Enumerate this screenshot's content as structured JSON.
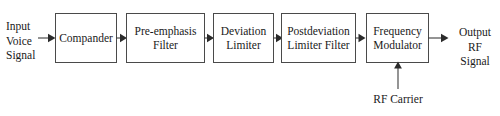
{
  "diagram": {
    "type": "block-diagram",
    "background_color": "#ffffff",
    "stroke_color": "#3d3d3d",
    "text_color": "#1a1a1a",
    "blocks": [
      {
        "id": "compander",
        "label": "Compander"
      },
      {
        "id": "pre-emphasis-filter",
        "label": "Pre-emphasis\nFilter"
      },
      {
        "id": "deviation-limiter",
        "label": "Deviation\nLimiter"
      },
      {
        "id": "postdeviation-limiter-filter",
        "label": "Postdeviation\nLimiter Filter"
      },
      {
        "id": "frequency-modulator",
        "label": "Frequency\nModulator"
      }
    ],
    "labels": {
      "input": "Input\nVoice\nSignal",
      "output": "Output\nRF Signal",
      "carrier": "RF Carrier"
    },
    "connections": [
      {
        "from": "input-voice-signal",
        "to": "compander",
        "direction": "right"
      },
      {
        "from": "compander",
        "to": "pre-emphasis-filter",
        "direction": "right"
      },
      {
        "from": "pre-emphasis-filter",
        "to": "deviation-limiter",
        "direction": "right"
      },
      {
        "from": "deviation-limiter",
        "to": "postdeviation-limiter-filter",
        "direction": "right"
      },
      {
        "from": "postdeviation-limiter-filter",
        "to": "frequency-modulator",
        "direction": "right"
      },
      {
        "from": "rf-carrier",
        "to": "frequency-modulator",
        "direction": "up"
      },
      {
        "from": "frequency-modulator",
        "to": "output-rf-signal",
        "direction": "right"
      }
    ]
  }
}
